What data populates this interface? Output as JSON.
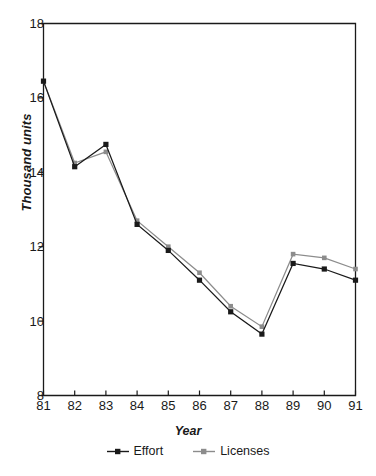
{
  "chart_data": {
    "type": "line",
    "title": "",
    "xlabel": "Year",
    "ylabel": "Thousand units",
    "categories": [
      "81",
      "82",
      "83",
      "84",
      "85",
      "86",
      "87",
      "88",
      "89",
      "90",
      "91"
    ],
    "x": [
      81,
      82,
      83,
      84,
      85,
      86,
      87,
      88,
      89,
      90,
      91
    ],
    "xlim": [
      81,
      91
    ],
    "ylim": [
      8,
      18
    ],
    "yticks": [
      8,
      10,
      12,
      14,
      16,
      18
    ],
    "xticks": [
      "81",
      "82",
      "83",
      "84",
      "85",
      "86",
      "87",
      "88",
      "89",
      "90",
      "91"
    ],
    "grid": false,
    "legend_position": "bottom-center",
    "series": [
      {
        "name": "Effort",
        "color": "#1a1a1a",
        "marker": "square",
        "values": [
          16.45,
          14.15,
          14.75,
          12.6,
          11.9,
          11.1,
          10.25,
          9.65,
          11.55,
          11.4,
          11.1
        ]
      },
      {
        "name": "Licenses",
        "color": "#8c8c8c",
        "marker": "square",
        "values": [
          16.45,
          14.25,
          14.55,
          12.7,
          12.0,
          11.3,
          10.4,
          9.85,
          11.8,
          11.7,
          11.4
        ]
      }
    ]
  },
  "legend": {
    "items": [
      {
        "label": "Effort",
        "color": "#1a1a1a"
      },
      {
        "label": "Licenses",
        "color": "#8c8c8c"
      }
    ]
  },
  "axes": {
    "frame_color": "#1a1a1a"
  }
}
